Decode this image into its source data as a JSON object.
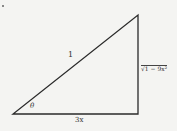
{
  "diagram": {
    "type": "right-triangle",
    "vertices": {
      "bottom_left": [
        13,
        114
      ],
      "right_angle": [
        138,
        114
      ],
      "top": [
        138,
        15
      ]
    },
    "labels": {
      "hypotenuse": "1",
      "angle": "θ",
      "base": "3x",
      "height": "√1 − 9x²"
    },
    "stroke_color": "#2a2a2a",
    "background": "#f4f4f2"
  }
}
